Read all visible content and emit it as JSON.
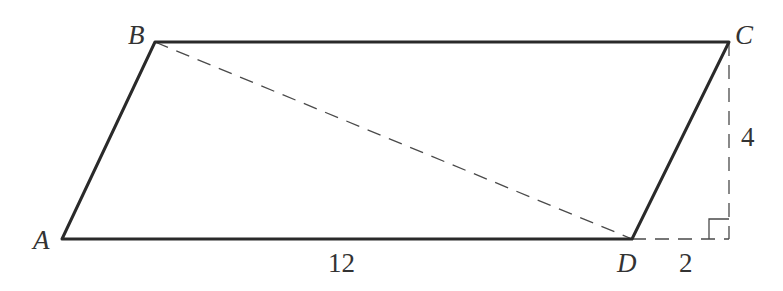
{
  "diagram": {
    "type": "geometry",
    "shape": "parallelogram",
    "vertices": {
      "A": {
        "label": "A",
        "x": 62,
        "y": 239
      },
      "B": {
        "label": "B",
        "x": 155,
        "y": 42
      },
      "C": {
        "label": "C",
        "x": 729,
        "y": 42
      },
      "D": {
        "label": "D",
        "x": 632,
        "y": 239
      }
    },
    "foot": {
      "x": 729,
      "y": 239
    },
    "edges_solid": [
      "AB",
      "BC",
      "CD",
      "DA"
    ],
    "edges_dashed": [
      "BD",
      "C-foot",
      "D-foot"
    ],
    "measurements": {
      "base_AD": "12",
      "height": "4",
      "extension": "2"
    },
    "right_angle_marker": {
      "at": "foot",
      "size": 20
    },
    "colors": {
      "line": "#2a2a2a",
      "dashed": "#4a4a4a",
      "text": "#333333",
      "background": "#ffffff"
    }
  }
}
